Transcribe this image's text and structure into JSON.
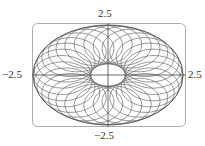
{
  "chart_data": {
    "type": "line",
    "title": "",
    "xlabel": "",
    "ylabel": "",
    "xlim": [
      -2.5,
      2.5
    ],
    "ylim": [
      -2.5,
      2.5
    ],
    "tick_labels": {
      "top": "2.5",
      "bottom": "−2.5",
      "left": "−2.5",
      "right": "2.5"
    },
    "grid": false,
    "axes_through_origin": true,
    "frame": "rounded-rectangle",
    "n_loops": 30,
    "outer_semi_axes_px": [
      75,
      50
    ],
    "inner_hole_semi_axes_px": [
      17,
      11
    ],
    "colors": {
      "curve": "#555555",
      "axes": "#444444",
      "frame": "#aaaaaa"
    }
  }
}
